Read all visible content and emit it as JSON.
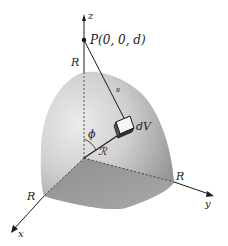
{
  "diagram": {
    "type": "3d-geometry",
    "axes": {
      "z": {
        "label": "z"
      },
      "x": {
        "label": "x"
      },
      "y": {
        "label": "y"
      }
    },
    "point": {
      "label": "P(0, 0, d)"
    },
    "radius_labels": {
      "top": "R",
      "x_end": "R",
      "y_end": "R"
    },
    "distance_label": "s",
    "volume_element_label": "dV",
    "position_vector_label": "ℛ",
    "angle_label": "ϕ",
    "colors": {
      "surface_light": "#e6e6e6",
      "surface_mid": "#bdbdbd",
      "surface_dark": "#8a8a8a",
      "base": "#9a9a9a",
      "lines": "#1a1a1a"
    }
  }
}
